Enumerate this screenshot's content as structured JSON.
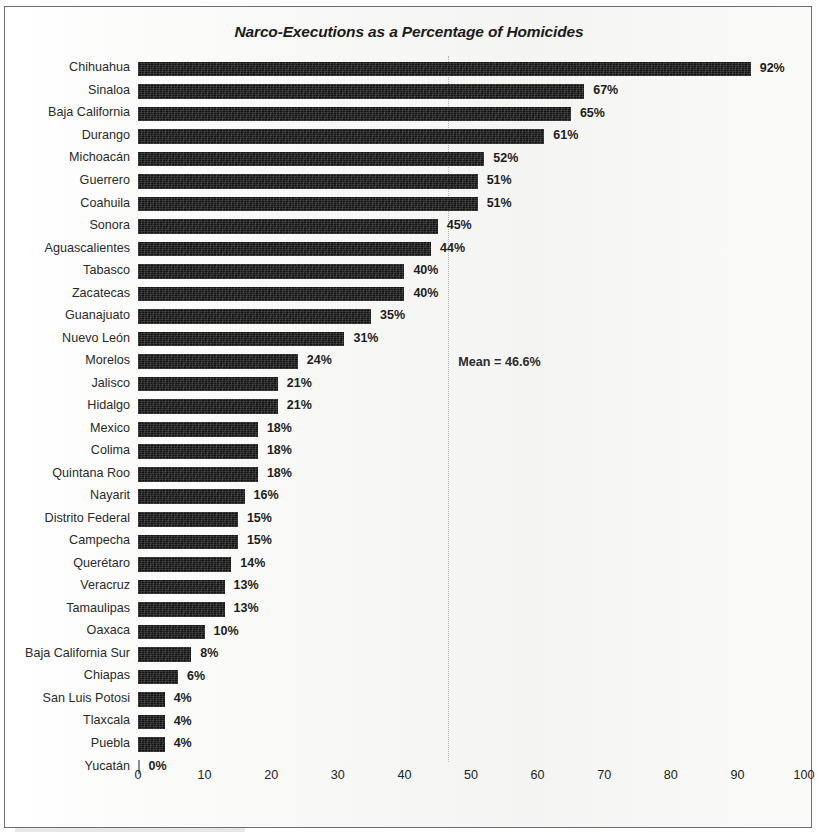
{
  "chart_data": {
    "type": "bar",
    "orientation": "horizontal",
    "title": "Narco-Executions as a Percentage of Homicides",
    "xlabel": "",
    "ylabel": "",
    "xlim": [
      0,
      100
    ],
    "xticks": [
      "0",
      "10",
      "20",
      "30",
      "40",
      "50",
      "60",
      "70",
      "80",
      "90",
      "100"
    ],
    "grid": false,
    "legend": null,
    "bar_color": "#131313",
    "categories": [
      "Chihuahua",
      "Sinaloa",
      "Baja California",
      "Durango",
      "Michoacán",
      "Guerrero",
      "Coahuila",
      "Sonora",
      "Aguascalientes",
      "Tabasco",
      "Zacatecas",
      "Guanajuato",
      "Nuevo León",
      "Morelos",
      "Jalisco",
      "Hidalgo",
      "Mexico",
      "Colima",
      "Quintana Roo",
      "Nayarit",
      "Distrito Federal",
      "Campecha",
      "Querétaro",
      "Veracruz",
      "Tamaulipas",
      "Oaxaca",
      "Baja California Sur",
      "Chiapas",
      "San Luis Potosi",
      "Tlaxcala",
      "Puebla",
      "Yucatán"
    ],
    "values": [
      92,
      67,
      65,
      61,
      52,
      51,
      51,
      45,
      44,
      40,
      40,
      35,
      31,
      24,
      21,
      21,
      18,
      18,
      18,
      16,
      15,
      15,
      14,
      13,
      13,
      10,
      8,
      6,
      4,
      4,
      4,
      0
    ],
    "value_labels": [
      "92%",
      "67%",
      "65%",
      "61%",
      "52%",
      "51%",
      "51%",
      "45%",
      "44%",
      "40%",
      "40%",
      "35%",
      "31%",
      "24%",
      "21%",
      "21%",
      "18%",
      "18%",
      "18%",
      "16%",
      "15%",
      "15%",
      "14%",
      "13%",
      "13%",
      "10%",
      "8%",
      "6%",
      "4%",
      "4%",
      "4%",
      "0%"
    ],
    "annotations": [
      {
        "name": "mean-line",
        "label": "Mean = 46.6%",
        "value": 46.6
      }
    ]
  }
}
